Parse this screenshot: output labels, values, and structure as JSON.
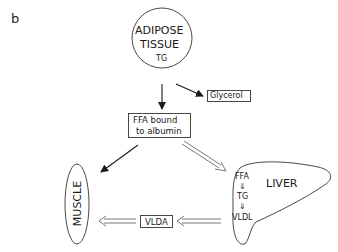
{
  "panel_label": "b",
  "nodes": {
    "adipose": {
      "line1": "ADIPOSE",
      "line2": "TISSUE",
      "sub": "TG"
    },
    "glycerol": {
      "label": "Glycerol"
    },
    "ffa_albumin": {
      "line1": "FFA bound",
      "line2": "to albumin"
    },
    "muscle": {
      "label": "MUSCLE"
    },
    "vlda": {
      "label": "VLDA"
    },
    "liver": {
      "label": "LIVER",
      "steps": [
        "FFA",
        "TG",
        "VLDL"
      ],
      "step_arrow": "⇓"
    }
  },
  "edges": [
    {
      "from": "adipose",
      "to": "ffa_albumin",
      "style": "single"
    },
    {
      "from": "adipose",
      "to": "glycerol",
      "style": "single"
    },
    {
      "from": "ffa_albumin",
      "to": "muscle",
      "style": "single"
    },
    {
      "from": "ffa_albumin",
      "to": "liver",
      "style": "double"
    },
    {
      "from": "liver",
      "to": "vlda",
      "style": "double"
    },
    {
      "from": "vlda",
      "to": "muscle",
      "style": "double"
    }
  ]
}
